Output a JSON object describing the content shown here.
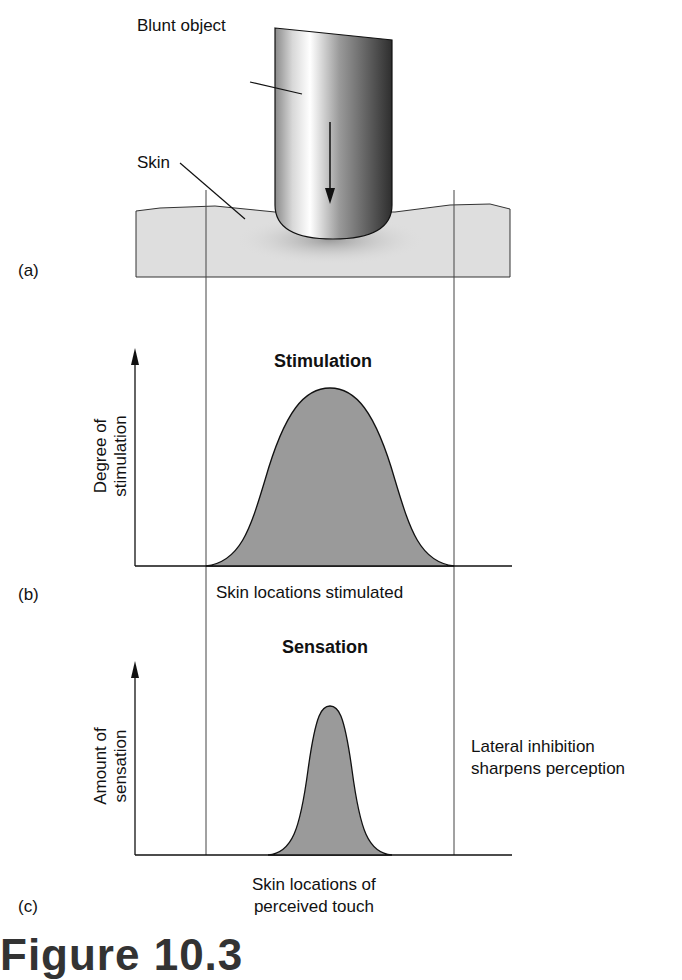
{
  "panel_a": {
    "letter": "(a)",
    "object_label": "Blunt object",
    "skin_label": "Skin"
  },
  "panel_b": {
    "letter": "(b)",
    "title": "Stimulation",
    "ylabel_line1": "Degree of",
    "ylabel_line2": "stimulation",
    "xlabel": "Skin locations stimulated"
  },
  "panel_c": {
    "letter": "(c)",
    "title": "Sensation",
    "ylabel_line1": "Amount of",
    "ylabel_line2": "sensation",
    "xlabel_line1": "Skin locations of",
    "xlabel_line2": "perceived touch",
    "note_line1": "Lateral inhibition",
    "note_line2": "sharpens perception"
  },
  "caption": "Figure 10.3",
  "colors": {
    "fill": "#9a9a9a",
    "skin": "#dedede",
    "line": "#222222"
  }
}
